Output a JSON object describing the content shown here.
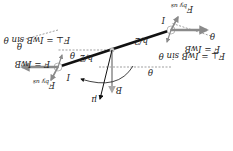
{
  "figure": {
    "orientation_deg": 180,
    "colors": {
      "loop_side": "#111111",
      "force_arrow": "#8a8a8a",
      "field_arrow": "#a8a8a8",
      "dashed_line": "#777777",
      "normal_vector": "#111111",
      "text": "#222222"
    },
    "labels": {
      "half_width_left": "h/2",
      "half_width_right": "h/2",
      "theta_top_left": "θ",
      "theta_top_right": "θ",
      "theta_left_dash": "θ",
      "theta_right_dash": "θ",
      "force_left": "F = IwB",
      "force_right": "F = IwB",
      "force_perp_left": "F⊥ = IwB sin θ",
      "force_perp_right": "F⊥ = IwB sin θ",
      "current_left": "I",
      "current_right": "I",
      "f_by_us_left": "F",
      "f_by_us_left_sub": "by us",
      "f_by_us_right": "F",
      "f_by_us_right_sub": "by us",
      "field": "B",
      "normal": "μ"
    }
  }
}
